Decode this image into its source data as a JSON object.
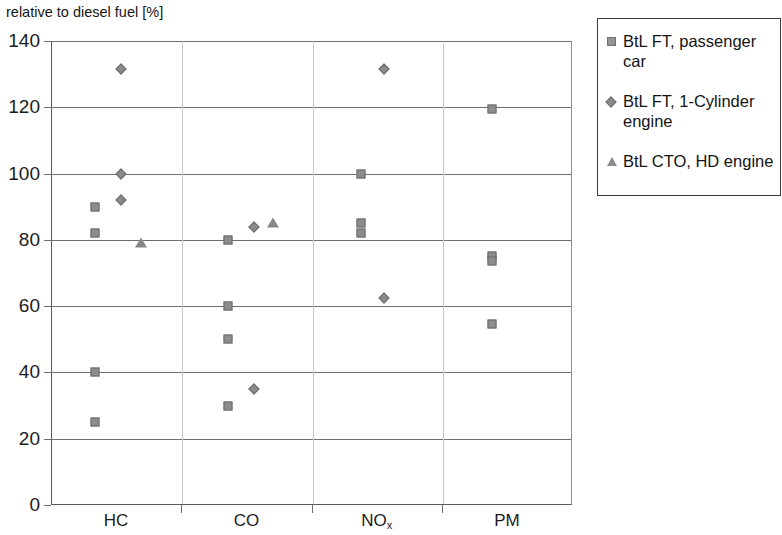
{
  "chart_data": {
    "type": "scatter",
    "title": "",
    "ylabel": "relative to diesel fuel [%]",
    "xlabel": "",
    "ylim": [
      0,
      140
    ],
    "ytick_step": 20,
    "yticks": [
      "0",
      "20",
      "40",
      "60",
      "80",
      "100",
      "120",
      "140"
    ],
    "grid": "horizontal",
    "legend_position": "right",
    "categories": [
      "HC",
      "CO",
      "NOx",
      "PM"
    ],
    "category_labels_html": [
      "HC",
      "CO",
      "NO<sub>x</sub>",
      "PM"
    ],
    "series": [
      {
        "name": "BtL FT, passenger car",
        "marker": "square",
        "color": "#8c8c8c",
        "points": [
          {
            "category": "HC",
            "x_frac": 0.33,
            "value": 90
          },
          {
            "category": "HC",
            "x_frac": 0.33,
            "value": 82
          },
          {
            "category": "HC",
            "x_frac": 0.33,
            "value": 40
          },
          {
            "category": "HC",
            "x_frac": 0.33,
            "value": 25
          },
          {
            "category": "CO",
            "x_frac": 0.35,
            "value": 80
          },
          {
            "category": "CO",
            "x_frac": 0.35,
            "value": 60
          },
          {
            "category": "CO",
            "x_frac": 0.35,
            "value": 50
          },
          {
            "category": "CO",
            "x_frac": 0.35,
            "value": 30
          },
          {
            "category": "NOx",
            "x_frac": 0.37,
            "value": 100
          },
          {
            "category": "NOx",
            "x_frac": 0.37,
            "value": 85
          },
          {
            "category": "NOx",
            "x_frac": 0.37,
            "value": 82
          },
          {
            "category": "PM",
            "x_frac": 0.38,
            "value": 119.5
          },
          {
            "category": "PM",
            "x_frac": 0.38,
            "value": 75
          },
          {
            "category": "PM",
            "x_frac": 0.38,
            "value": 73.5
          },
          {
            "category": "PM",
            "x_frac": 0.38,
            "value": 54.5
          }
        ]
      },
      {
        "name": "BtL FT, 1-Cylinder engine",
        "marker": "diamond",
        "color": "#8a8a8a",
        "points": [
          {
            "category": "HC",
            "x_frac": 0.53,
            "value": 131.5
          },
          {
            "category": "HC",
            "x_frac": 0.53,
            "value": 100
          },
          {
            "category": "HC",
            "x_frac": 0.53,
            "value": 92
          },
          {
            "category": "CO",
            "x_frac": 0.55,
            "value": 84
          },
          {
            "category": "CO",
            "x_frac": 0.55,
            "value": 35
          },
          {
            "category": "NOx",
            "x_frac": 0.55,
            "value": 131.5
          },
          {
            "category": "NOx",
            "x_frac": 0.55,
            "value": 62.5
          }
        ]
      },
      {
        "name": "BtL CTO, HD engine",
        "marker": "triangle",
        "color": "#878787",
        "points": [
          {
            "category": "HC",
            "x_frac": 0.68,
            "value": 79
          },
          {
            "category": "CO",
            "x_frac": 0.7,
            "value": 85
          }
        ]
      }
    ]
  },
  "legend": {
    "entries": [
      {
        "label": "BtL FT, passenger car",
        "marker": "square"
      },
      {
        "label": "BtL FT, 1-Cylinder engine",
        "marker": "diamond"
      },
      {
        "label": "BtL CTO, HD engine",
        "marker": "triangle"
      }
    ]
  }
}
